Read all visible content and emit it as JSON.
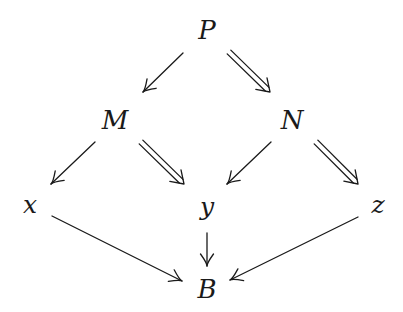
{
  "diagram": {
    "type": "commutative-diagram",
    "nodes": [
      {
        "id": "P",
        "label": "P",
        "x": 207,
        "y": 30
      },
      {
        "id": "M",
        "label": "M",
        "x": 115,
        "y": 120
      },
      {
        "id": "N",
        "label": "N",
        "x": 292,
        "y": 120
      },
      {
        "id": "x",
        "label": "x",
        "x": 30,
        "y": 206
      },
      {
        "id": "y",
        "label": "y",
        "x": 207,
        "y": 206
      },
      {
        "id": "z",
        "label": "z",
        "x": 378,
        "y": 206
      },
      {
        "id": "B",
        "label": "B",
        "x": 207,
        "y": 289
      }
    ],
    "edges": [
      {
        "from": "P",
        "to": "M",
        "style": "single",
        "x1": 183,
        "y1": 53,
        "x2": 143,
        "y2": 92
      },
      {
        "from": "P",
        "to": "N",
        "style": "double",
        "x1": 229,
        "y1": 52,
        "x2": 270,
        "y2": 92
      },
      {
        "from": "M",
        "to": "x",
        "style": "single",
        "x1": 95,
        "y1": 142,
        "x2": 51,
        "y2": 184
      },
      {
        "from": "M",
        "to": "y",
        "style": "double",
        "x1": 141,
        "y1": 142,
        "x2": 184,
        "y2": 184
      },
      {
        "from": "N",
        "to": "y",
        "style": "single",
        "x1": 271,
        "y1": 142,
        "x2": 227,
        "y2": 184
      },
      {
        "from": "N",
        "to": "z",
        "style": "double",
        "x1": 316,
        "y1": 142,
        "x2": 358,
        "y2": 184
      },
      {
        "from": "x",
        "to": "B",
        "style": "single",
        "x1": 52,
        "y1": 216,
        "x2": 182,
        "y2": 281
      },
      {
        "from": "y",
        "to": "B",
        "style": "single",
        "x1": 207,
        "y1": 233,
        "x2": 207,
        "y2": 266
      },
      {
        "from": "z",
        "to": "B",
        "style": "single",
        "x1": 358,
        "y1": 217,
        "x2": 230,
        "y2": 280
      }
    ],
    "colors": {
      "ink": "#1a1a1a",
      "background": "#ffffff"
    }
  }
}
